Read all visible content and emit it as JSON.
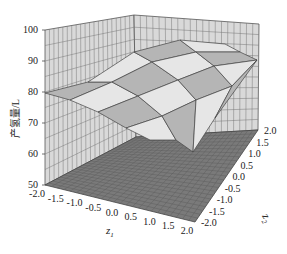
{
  "chart_data": {
    "type": "surface3d",
    "title": "",
    "xlabel": "z1",
    "ylabel": "z2",
    "zlabel": "产氢量/L",
    "x_ticks": [
      "-2.0",
      "-1.5",
      "-1.0",
      "-0.5",
      "0.0",
      "0.5",
      "1.0",
      "1.5",
      "2.0"
    ],
    "y_ticks": [
      "-2.0",
      "-1.5",
      "-1.0",
      "-0.5",
      "0.0",
      "0.5",
      "1.0",
      "1.5",
      "2.0"
    ],
    "z_ticks": [
      "50",
      "60",
      "70",
      "80",
      "90",
      "100"
    ],
    "xlim": [
      -2.0,
      2.0
    ],
    "ylim": [
      -2.0,
      2.0
    ],
    "zlim": [
      50,
      100
    ],
    "grid": true,
    "surface_grid": {
      "x": [
        -2.0,
        -1.0,
        0.0,
        1.0,
        2.0
      ],
      "y": [
        -2.0,
        -1.0,
        0.0,
        1.0,
        2.0
      ],
      "z": [
        [
          60,
          72,
          80,
          84,
          82
        ],
        [
          66,
          79,
          86,
          90,
          88
        ],
        [
          70,
          83,
          90,
          93,
          92
        ],
        [
          72,
          84,
          91,
          94,
          93
        ],
        [
          71,
          82,
          88,
          91,
          89
        ]
      ]
    },
    "colors": {
      "wall": "#d9d9d9",
      "floor": "#7a7a7a",
      "surface_light": "#ececec",
      "surface_dark": "#9e9e9e",
      "grid": "#555555"
    }
  },
  "labels": {
    "z_axis": "产氢量/L",
    "x_axis": "z",
    "x_axis_sub": "1",
    "y_axis": "z",
    "y_axis_sub": "2"
  }
}
